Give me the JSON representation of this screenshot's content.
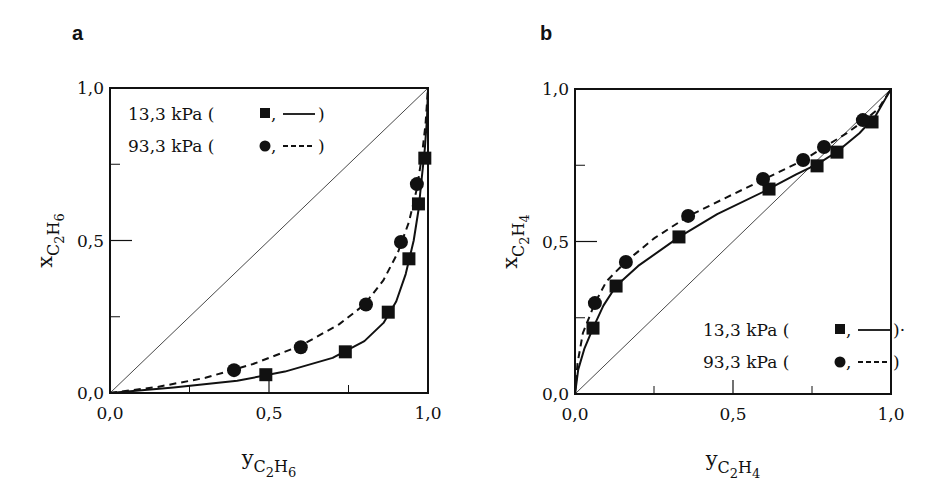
{
  "chart_data": [
    {
      "type": "scatter",
      "panel": "a",
      "title": "",
      "xlabel": {
        "main": "y",
        "sub1": "C",
        "n1": "2",
        "sub2": "H",
        "n2": "6"
      },
      "ylabel": {
        "main": "x",
        "sub1": "C",
        "n1": "2",
        "sub2": "H",
        "n2": "6"
      },
      "xlim": [
        0,
        1
      ],
      "ylim": [
        0,
        1
      ],
      "xticks": [
        {
          "v": 0,
          "label": "0,0"
        },
        {
          "v": 0.5,
          "label": "0,5"
        },
        {
          "v": 1,
          "label": "1,0"
        }
      ],
      "yticks": [
        {
          "v": 0,
          "label": "0,0"
        },
        {
          "v": 0.5,
          "label": "0,5"
        },
        {
          "v": 1,
          "label": "1,0"
        }
      ],
      "minor_ticks": [
        0.25,
        0.75
      ],
      "grid": false,
      "diagonal": true,
      "legend_position": "top-left",
      "legend": [
        {
          "text": "13,3 kPa (",
          "marker": "square",
          "line": "solid",
          "suffix": ")"
        },
        {
          "text": "93,3 kPa (",
          "marker": "circle",
          "line": "dashed",
          "suffix": ")"
        }
      ],
      "series": [
        {
          "name": "13,3 kPa",
          "marker": "square",
          "line": "solid",
          "points": [
            [
              0.49,
              0.06
            ],
            [
              0.74,
              0.135
            ],
            [
              0.875,
              0.265
            ],
            [
              0.94,
              0.44
            ],
            [
              0.97,
              0.62
            ],
            [
              0.99,
              0.77
            ]
          ],
          "curve": [
            [
              0,
              0
            ],
            [
              0.2,
              0.018
            ],
            [
              0.4,
              0.04
            ],
            [
              0.55,
              0.07
            ],
            [
              0.7,
              0.115
            ],
            [
              0.8,
              0.17
            ],
            [
              0.86,
              0.23
            ],
            [
              0.9,
              0.3
            ],
            [
              0.93,
              0.39
            ],
            [
              0.955,
              0.5
            ],
            [
              0.97,
              0.6
            ],
            [
              0.98,
              0.7
            ],
            [
              0.99,
              0.8
            ],
            [
              0.997,
              0.9
            ],
            [
              1,
              1
            ]
          ]
        },
        {
          "name": "93,3 kPa",
          "marker": "circle",
          "line": "dashed",
          "points": [
            [
              0.39,
              0.075
            ],
            [
              0.6,
              0.15
            ],
            [
              0.805,
              0.29
            ],
            [
              0.915,
              0.495
            ],
            [
              0.965,
              0.685
            ]
          ],
          "curve": [
            [
              0,
              0
            ],
            [
              0.15,
              0.02
            ],
            [
              0.3,
              0.05
            ],
            [
              0.45,
              0.095
            ],
            [
              0.6,
              0.155
            ],
            [
              0.72,
              0.225
            ],
            [
              0.8,
              0.29
            ],
            [
              0.86,
              0.37
            ],
            [
              0.905,
              0.46
            ],
            [
              0.94,
              0.56
            ],
            [
              0.965,
              0.67
            ],
            [
              0.98,
              0.77
            ],
            [
              0.992,
              0.88
            ],
            [
              1,
              1
            ]
          ]
        }
      ]
    },
    {
      "type": "scatter",
      "panel": "b",
      "title": "",
      "xlabel": {
        "main": "y",
        "sub1": "C",
        "n1": "2",
        "sub2": "H",
        "n2": "4"
      },
      "ylabel": {
        "main": "x",
        "sub1": "C",
        "n1": "2",
        "sub2": "H",
        "n2": "4"
      },
      "xlim": [
        0,
        1
      ],
      "ylim": [
        0,
        1
      ],
      "xticks": [
        {
          "v": 0,
          "label": "0,0"
        },
        {
          "v": 0.5,
          "label": "0,5"
        },
        {
          "v": 1,
          "label": "1,0"
        }
      ],
      "yticks": [
        {
          "v": 0,
          "label": "0,0"
        },
        {
          "v": 0.5,
          "label": "0,5"
        },
        {
          "v": 1,
          "label": "1,0"
        }
      ],
      "minor_ticks": [
        0.25,
        0.75
      ],
      "grid": false,
      "diagonal": true,
      "legend_position": "bottom-right",
      "legend": [
        {
          "text": "13,3 kPa (",
          "marker": "square",
          "line": "solid",
          "suffix": ")·"
        },
        {
          "text": "93,3 kPa (",
          "marker": "circle",
          "line": "dashed",
          "suffix": ")"
        }
      ],
      "series": [
        {
          "name": "13,3 kPa",
          "marker": "square",
          "line": "solid",
          "points": [
            [
              0.057,
              0.216
            ],
            [
              0.13,
              0.354
            ],
            [
              0.329,
              0.515
            ],
            [
              0.614,
              0.672
            ],
            [
              0.766,
              0.748
            ],
            [
              0.829,
              0.793
            ],
            [
              0.94,
              0.892
            ]
          ],
          "curve": [
            [
              0,
              0
            ],
            [
              0.01,
              0.08
            ],
            [
              0.03,
              0.15
            ],
            [
              0.057,
              0.216
            ],
            [
              0.09,
              0.29
            ],
            [
              0.13,
              0.354
            ],
            [
              0.2,
              0.42
            ],
            [
              0.33,
              0.515
            ],
            [
              0.45,
              0.59
            ],
            [
              0.6,
              0.665
            ],
            [
              0.7,
              0.72
            ],
            [
              0.77,
              0.755
            ],
            [
              0.83,
              0.795
            ],
            [
              0.9,
              0.855
            ],
            [
              0.95,
              0.91
            ],
            [
              1,
              1
            ]
          ]
        },
        {
          "name": "93,3 kPa",
          "marker": "circle",
          "line": "dashed",
          "points": [
            [
              0.063,
              0.298
            ],
            [
              0.161,
              0.433
            ],
            [
              0.358,
              0.584
            ],
            [
              0.595,
              0.705
            ],
            [
              0.722,
              0.767
            ],
            [
              0.788,
              0.81
            ],
            [
              0.911,
              0.898
            ]
          ],
          "curve": [
            [
              0,
              0
            ],
            [
              0.008,
              0.1
            ],
            [
              0.025,
              0.2
            ],
            [
              0.063,
              0.298
            ],
            [
              0.1,
              0.37
            ],
            [
              0.16,
              0.433
            ],
            [
              0.25,
              0.51
            ],
            [
              0.36,
              0.584
            ],
            [
              0.48,
              0.645
            ],
            [
              0.6,
              0.705
            ],
            [
              0.72,
              0.765
            ],
            [
              0.79,
              0.81
            ],
            [
              0.86,
              0.855
            ],
            [
              0.92,
              0.9
            ],
            [
              0.96,
              0.935
            ],
            [
              1,
              1
            ]
          ]
        }
      ]
    }
  ]
}
